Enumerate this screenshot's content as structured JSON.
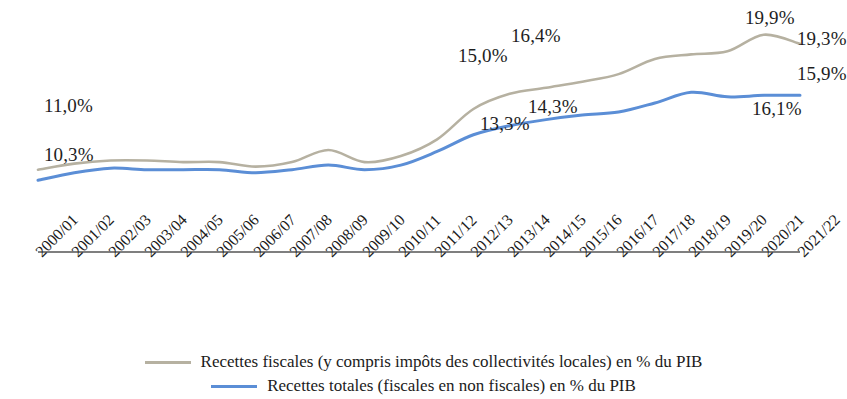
{
  "chart_data": {
    "type": "line",
    "title": "",
    "xlabel": "",
    "ylabel": "",
    "categories": [
      "2000/01",
      "2001/02",
      "2002/03",
      "2003/04",
      "2004/05",
      "2005/06",
      "2006/07",
      "2007/08",
      "2008/09",
      "2009/10",
      "2010/11",
      "2011/12",
      "2012/13",
      "2013/14",
      "2014/15",
      "2015/16",
      "2016/17",
      "2017/18",
      "2018/19",
      "2019/20",
      "2020/21",
      "2021/22"
    ],
    "ylim": [
      9.0,
      21.0
    ],
    "grid": false,
    "legend_position": "bottom",
    "series": [
      {
        "name": "Recettes fiscales (y compris impôts des collectivités locales) en % du PIB",
        "color": "#b6b1a1",
        "values": [
          11.0,
          11.4,
          11.6,
          11.6,
          11.5,
          11.5,
          11.2,
          11.5,
          12.3,
          11.5,
          11.9,
          13.0,
          15.0,
          16.0,
          16.4,
          16.8,
          17.3,
          18.3,
          18.6,
          18.8,
          19.9,
          19.3
        ]
      },
      {
        "name": "Recettes totales (fiscales en non fiscales) en % du PIB",
        "color": "#5b8ed6",
        "values": [
          10.3,
          10.8,
          11.1,
          11.0,
          11.0,
          11.0,
          10.8,
          11.0,
          11.3,
          11.0,
          11.3,
          12.2,
          13.3,
          13.9,
          14.3,
          14.6,
          14.8,
          15.4,
          16.1,
          15.8,
          15.9,
          15.9
        ]
      }
    ],
    "annotations": [
      {
        "text": "11,0%",
        "series": "Recettes fiscales",
        "point": "2000/01",
        "x": 44,
        "y": 95,
        "align": "left"
      },
      {
        "text": "10,3%",
        "series": "Recettes totales",
        "point": "2000/01",
        "x": 44,
        "y": 144,
        "align": "left"
      },
      {
        "text": "15,0%",
        "series": "Recettes fiscales",
        "point": "2012/13",
        "x": 458,
        "y": 45,
        "align": "left"
      },
      {
        "text": "16,4%",
        "series": "Recettes fiscales",
        "point": "2014/15",
        "x": 511,
        "y": 25,
        "align": "left"
      },
      {
        "text": "13,3%",
        "series": "Recettes totales",
        "point": "2012/13",
        "x": 480,
        "y": 113,
        "align": "left"
      },
      {
        "text": "14,3%",
        "series": "Recettes totales",
        "point": "2014/15",
        "x": 528,
        "y": 96,
        "align": "left"
      },
      {
        "text": "19,9%",
        "series": "Recettes fiscales",
        "point": "2020/21",
        "x": 745,
        "y": 7,
        "align": "left"
      },
      {
        "text": "19,3%",
        "series": "Recettes fiscales",
        "point": "2021/22",
        "x": 797,
        "y": 28,
        "align": "left"
      },
      {
        "text": "15,9%",
        "series": "Recettes totales",
        "point": "2021/22",
        "x": 797,
        "y": 63,
        "align": "left"
      },
      {
        "text": "16,1%",
        "series": "Recettes totales",
        "point": "2018/19",
        "x": 752,
        "y": 98,
        "align": "left"
      }
    ]
  },
  "axis": {
    "line_color": "#555555",
    "x_start_px": 38,
    "x_end_px": 800,
    "y_px": 252
  },
  "legend": {
    "items": [
      {
        "label": "Recettes fiscales (y compris impôts des collectivités locales) en % du PIB",
        "color": "#b6b1a1",
        "swatch": "line-swatch-fiscales"
      },
      {
        "label": "Recettes totales (fiscales en non fiscales) en % du PIB",
        "color": "#5b8ed6",
        "swatch": "line-swatch-totales"
      }
    ]
  }
}
